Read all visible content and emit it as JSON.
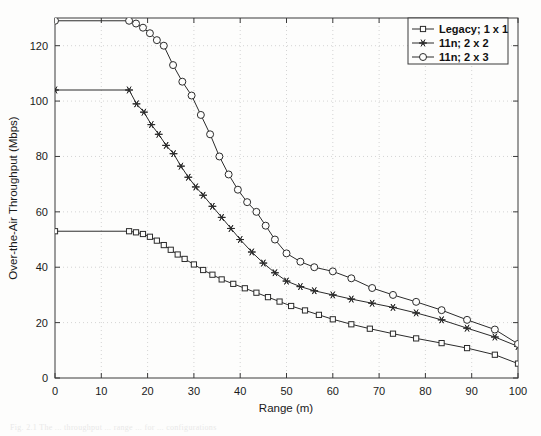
{
  "figure": {
    "background": "#fdfdfc",
    "caption_fragment": "Fig.  2.1    The ... throughput ... range ... for ... configurations"
  },
  "chart_data": {
    "type": "line",
    "title": "",
    "xlabel": "Range (m)",
    "ylabel": "Over-the-Air Throughput (Mbps)",
    "xlim": [
      0,
      100
    ],
    "ylim": [
      0,
      130
    ],
    "xticks": [
      0,
      10,
      20,
      30,
      40,
      50,
      60,
      70,
      80,
      90,
      100
    ],
    "yticks": [
      0,
      20,
      40,
      60,
      80,
      100,
      120
    ],
    "grid": true,
    "grid_style": "dotted",
    "legend_position": "top-right",
    "line_color": "#2b2b2b",
    "series": [
      {
        "name": "Legacy; 1 x 1",
        "marker": "square",
        "x": [
          0,
          16,
          17.5,
          19,
          20.5,
          22,
          23.5,
          25,
          26.5,
          28,
          30,
          32,
          34,
          36,
          38.5,
          41,
          43.5,
          46,
          48.5,
          51,
          54,
          57,
          60,
          64,
          68,
          73,
          78,
          83.5,
          89,
          95,
          100
        ],
        "y": [
          53,
          53,
          52.6,
          52,
          51,
          49.6,
          48,
          46.3,
          44.6,
          43,
          41,
          39,
          37.3,
          35.6,
          34,
          32.4,
          30.8,
          29.2,
          27.6,
          26,
          24.4,
          22.8,
          21.2,
          19.4,
          17.8,
          16,
          14.3,
          12.6,
          10.8,
          8.4,
          5.2
        ]
      },
      {
        "name": "11n; 2 x 2",
        "marker": "star",
        "x": [
          0,
          16,
          17.6,
          19.2,
          20.8,
          22.4,
          24,
          25.6,
          27.2,
          28.8,
          30.4,
          32,
          34,
          36,
          38,
          40,
          42.5,
          45,
          47.5,
          50,
          53,
          56,
          60,
          64,
          68.5,
          73,
          78,
          83.5,
          89,
          95,
          100
        ],
        "y": [
          104,
          104,
          99,
          96,
          91.5,
          88,
          84,
          81,
          76.5,
          72.5,
          69,
          66,
          62,
          58,
          54,
          50,
          45.5,
          41.5,
          38,
          35,
          33,
          31.5,
          30,
          28.5,
          27,
          25.5,
          23.5,
          21,
          18,
          14.8,
          11.4
        ]
      },
      {
        "name": "11n; 2 x 3",
        "marker": "circle",
        "x": [
          0,
          16,
          17.5,
          19,
          20.5,
          22,
          23.5,
          25.5,
          27.5,
          29.5,
          31.5,
          33.5,
          35.5,
          37.5,
          39.5,
          41.5,
          43.5,
          45.5,
          47.5,
          50,
          53,
          56,
          60,
          64,
          68.5,
          73,
          78,
          83.5,
          89,
          95,
          100
        ],
        "y": [
          129,
          129,
          128,
          126.5,
          124.5,
          122,
          120,
          113,
          107,
          102,
          95,
          88,
          80,
          73.5,
          68,
          63.5,
          60,
          55,
          50,
          45,
          42,
          40,
          38.5,
          36,
          32.5,
          30,
          27.5,
          24.5,
          21,
          17.5,
          12.3
        ]
      }
    ]
  },
  "legend": {
    "items": [
      {
        "label": "Legacy; 1 x 1",
        "marker": "square-marker"
      },
      {
        "label": "11n; 2 x 2",
        "marker": "star-marker"
      },
      {
        "label": "11n; 2 x 3",
        "marker": "circle-marker"
      }
    ]
  }
}
